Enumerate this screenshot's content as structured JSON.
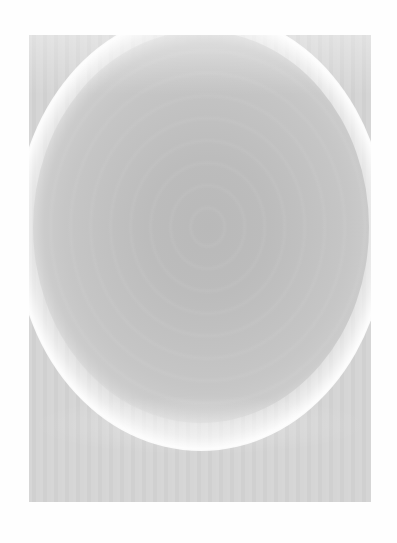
{
  "image": {
    "subject": "grayscale photographic print of a circular orb with bright halo",
    "colors": {
      "background": "#fefefe",
      "print_base": "#d4d4d4",
      "orb_center": "#b9b9b9",
      "halo": "#ffffff"
    }
  }
}
